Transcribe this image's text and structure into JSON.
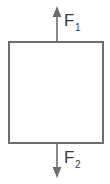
{
  "figure": {
    "kind": "free-body-force-diagram",
    "background_color": "#ffffff",
    "width": 110,
    "height": 184,
    "body": {
      "shape": "rectangle",
      "x": 8,
      "y": 41,
      "width": 96,
      "height": 103,
      "stroke_color": "#6e6e6e",
      "stroke_width": 2,
      "fill_color": "#ffffff"
    },
    "arrows": [
      {
        "name": "force-arrow-up",
        "direction": "up",
        "label": "F",
        "subscript": "1",
        "x": 57,
        "tail_y": 41,
        "head_y": 7,
        "color": "#6e6e6e",
        "stroke_width": 1.6,
        "head_width": 8,
        "head_length": 10,
        "label_x": 64,
        "label_y": 25,
        "sub_x": 76,
        "sub_y": 30
      },
      {
        "name": "force-arrow-down",
        "direction": "down",
        "label": "F",
        "subscript": "2",
        "x": 57,
        "tail_y": 144,
        "head_y": 177,
        "color": "#6e6e6e",
        "stroke_width": 1.6,
        "head_width": 8,
        "head_length": 10,
        "label_x": 64,
        "label_y": 163,
        "sub_x": 76,
        "sub_y": 168
      }
    ]
  }
}
